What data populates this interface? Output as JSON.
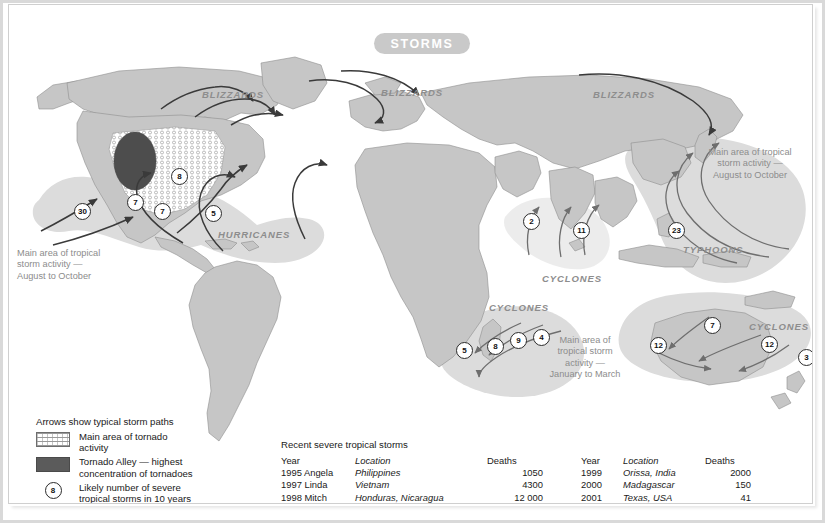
{
  "page": {
    "title": "STORMS",
    "accent_color": "#c9c9c9",
    "land_color": "#c6c6c6",
    "ocean_color": "#ffffff",
    "tornado_alley_color": "#4d4d4d",
    "storm_zone_color": "#d6d6d6"
  },
  "map_labels": {
    "blizzards_na": "BLIZZARDS",
    "blizzards_eu": "BLIZZARDS",
    "blizzards_asia": "BLIZZARDS",
    "hurricanes": "HURRICANES",
    "typhoons": "TYPHOONS",
    "cyclones_indian_north": "CYCLONES",
    "cyclones_indian_south": "CYCLONES",
    "cyclones_pacific": "CYCLONES"
  },
  "zone_notes": {
    "atlantic": "Main area of tropical\nstorm activity —\nAugust to October",
    "pacific_nw": "Main area of tropical\nstorm activity —\nAugust to October",
    "indian_s": "Main area of\ntropical storm\nactivity —\nJanuary to March"
  },
  "storm_counts": [
    {
      "value": "30",
      "x": 72,
      "y": 205
    },
    {
      "value": "7",
      "x": 125,
      "y": 196
    },
    {
      "value": "7",
      "x": 152,
      "y": 205
    },
    {
      "value": "8",
      "x": 169,
      "y": 170
    },
    {
      "value": "5",
      "x": 203,
      "y": 207
    },
    {
      "value": "2",
      "x": 521,
      "y": 215
    },
    {
      "value": "11",
      "x": 571,
      "y": 224
    },
    {
      "value": "23",
      "x": 666,
      "y": 224
    },
    {
      "value": "5",
      "x": 454,
      "y": 344
    },
    {
      "value": "8",
      "x": 485,
      "y": 340
    },
    {
      "value": "9",
      "x": 508,
      "y": 334
    },
    {
      "value": "4",
      "x": 531,
      "y": 331
    },
    {
      "value": "7",
      "x": 702,
      "y": 319
    },
    {
      "value": "12",
      "x": 648,
      "y": 339
    },
    {
      "value": "12",
      "x": 759,
      "y": 338
    },
    {
      "value": "3",
      "x": 796,
      "y": 351
    }
  ],
  "legend": {
    "title": "Arrows show typical storm paths",
    "items": [
      {
        "swatch": "hatch",
        "label": "Main area of tornado\nactivity"
      },
      {
        "swatch": "solid",
        "label": "Tornado Alley — highest\nconcentration of tornadoes"
      },
      {
        "swatch": "circle",
        "symbol": "8",
        "label": "Likely number of severe\ntropical storms in 10 years"
      }
    ]
  },
  "tables": {
    "title": "Recent severe tropical storms",
    "headers": [
      "Year",
      "Location",
      "Deaths"
    ],
    "left_rows": [
      {
        "year": "1995 Angela",
        "location": "Philippines",
        "deaths": "1050"
      },
      {
        "year": "1997 Linda",
        "location": "Vietnam",
        "deaths": "4300"
      },
      {
        "year": "1998 Mitch",
        "location": "Honduras, Nicaragua",
        "deaths": "12 000"
      }
    ],
    "right_rows": [
      {
        "year": "1999",
        "location": "Orissa, India",
        "deaths": "2000"
      },
      {
        "year": "2000",
        "location": "Madagascar",
        "deaths": "150"
      },
      {
        "year": "2001",
        "location": "Texas, USA",
        "deaths": "41"
      }
    ]
  }
}
